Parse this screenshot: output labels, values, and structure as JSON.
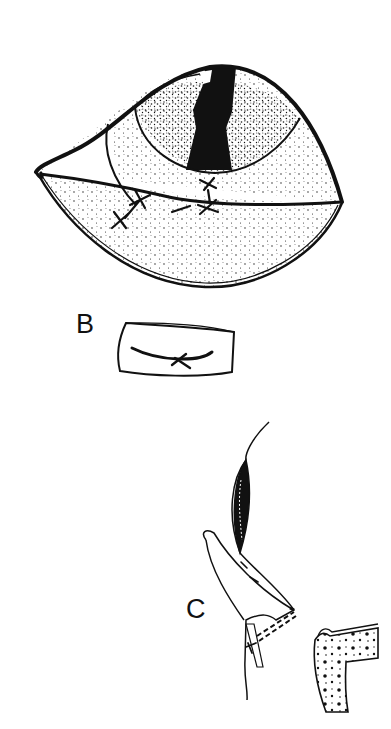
{
  "figure": {
    "panels": [
      {
        "id": "A",
        "label": "",
        "description": "eye with sutured lower lid flap over cornea"
      },
      {
        "id": "B",
        "label": "B",
        "description": "rectangular graft with curved suture line"
      },
      {
        "id": "C",
        "label": "C",
        "description": "cross-section of lid flap and orbit rim"
      }
    ]
  },
  "colors": {
    "ink": "#111111",
    "background": "#ffffff"
  }
}
